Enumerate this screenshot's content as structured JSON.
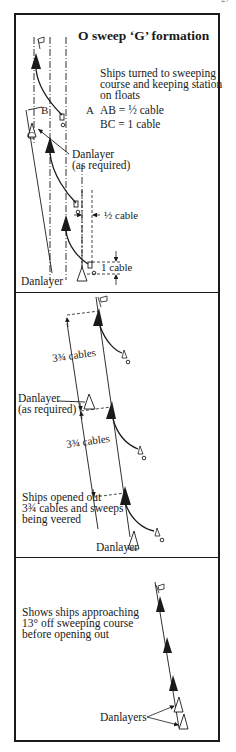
{
  "page": {
    "page_number": "27"
  },
  "figure": {
    "title": "O sweep ‘G’ formation",
    "panels": [
      {
        "id": "stage-1",
        "caption_lines": [
          "Ships turned to sweeping",
          "course and keeping station",
          "on floats"
        ],
        "equations": [
          "AB = ½ cable",
          "BC = 1 cable"
        ],
        "point_labels": [
          "A",
          "B",
          "C"
        ],
        "annotations": {
          "danlayer_optional_line1": "Danlayer",
          "danlayer_optional_line2": "(as required)",
          "lateral_spacing": "½ cable",
          "longitudinal_spacing": "1 cable",
          "danlayer": "Danlayer"
        },
        "ships": [
          {
            "role": "sweeper",
            "style": "filled"
          },
          {
            "role": "sweeper",
            "style": "filled"
          },
          {
            "role": "sweeper",
            "style": "filled"
          },
          {
            "role": "danlayer",
            "style": "outline"
          },
          {
            "role": "danlayer",
            "style": "outline"
          }
        ]
      },
      {
        "id": "stage-2",
        "caption_lines": [
          "Ships opened out",
          "3¾ cables and sweeps",
          "being veered"
        ],
        "annotations": {
          "spacing_upper": "3¾ cables",
          "spacing_lower": "3¾ cables",
          "danlayer_optional_line1": "Danlayer",
          "danlayer_optional_line2": "(as required)",
          "danlayer": "Danlayer"
        },
        "ships": [
          {
            "role": "sweeper",
            "style": "filled"
          },
          {
            "role": "sweeper",
            "style": "filled"
          },
          {
            "role": "sweeper",
            "style": "filled"
          },
          {
            "role": "danlayer",
            "style": "outline"
          },
          {
            "role": "danlayer",
            "style": "outline"
          }
        ]
      },
      {
        "id": "stage-3",
        "caption_lines": [
          "Shows ships approaching",
          "13° off sweeping course",
          "before opening out"
        ],
        "annotations": {
          "danlayers": "Danlayers"
        },
        "ships": [
          {
            "role": "sweeper",
            "style": "filled"
          },
          {
            "role": "sweeper",
            "style": "filled"
          },
          {
            "role": "sweeper",
            "style": "filled"
          },
          {
            "role": "danlayer",
            "style": "outline"
          },
          {
            "role": "danlayer",
            "style": "outline"
          }
        ]
      }
    ]
  },
  "colors": {
    "ink": "#1a1a1a",
    "paper": "#ffffff"
  }
}
